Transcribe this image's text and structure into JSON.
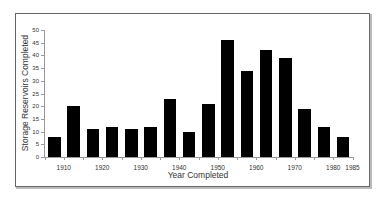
{
  "chart_data": {
    "type": "bar",
    "title": "",
    "xlabel": "Year Completed",
    "ylabel": "Storage Reservoirs Completed",
    "ylim": [
      0,
      50
    ],
    "yticks": [
      0,
      5,
      10,
      15,
      20,
      25,
      30,
      35,
      40,
      45,
      50
    ],
    "xtick_labels": [
      "1910",
      "1920",
      "1930",
      "1940",
      "1950",
      "1960",
      "1970",
      "1980",
      "1985"
    ],
    "grid": false,
    "legend": null,
    "categories": [
      "1905-1910",
      "1910-1915",
      "1915-1920",
      "1920-1925",
      "1925-1930",
      "1930-1935",
      "1935-1940",
      "1940-1945",
      "1945-1950",
      "1950-1955",
      "1955-1960",
      "1960-1965",
      "1965-1970",
      "1970-1975",
      "1975-1980",
      "1980-1985"
    ],
    "values": [
      8,
      20,
      11,
      12,
      11,
      12,
      23,
      10,
      21,
      46,
      34,
      42,
      39,
      19,
      12,
      8
    ],
    "bar_color": "#000000"
  },
  "labels": {
    "ylabel": "Storage Reservoirs Completed",
    "xlabel": "Year Completed"
  }
}
